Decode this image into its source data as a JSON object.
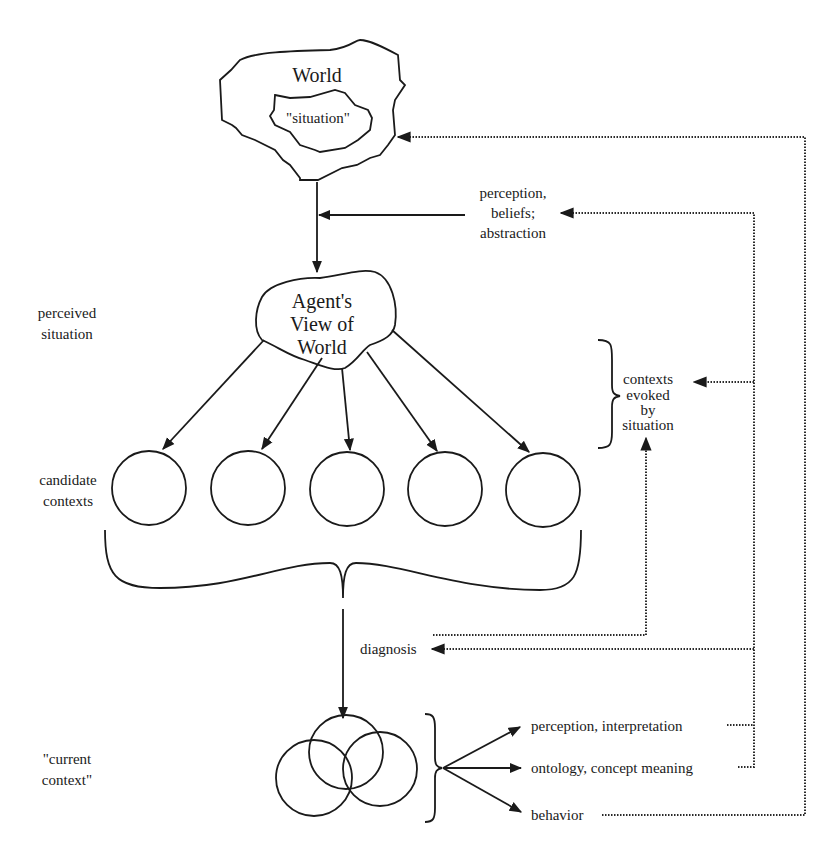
{
  "diagram": {
    "type": "flow-diagram",
    "colors": {
      "ink": "#1a1a1a",
      "background": "#ffffff"
    },
    "nodes": {
      "world": {
        "label": "World",
        "inner_label": "\"situation\""
      },
      "agent_view": {
        "line1": "Agent's",
        "line2": "View of",
        "line3": "World"
      },
      "candidate_contexts": {
        "count": 5
      },
      "current_context": {
        "count": 3
      }
    },
    "left_labels": {
      "perceived_situation": {
        "line1": "perceived",
        "line2": "situation"
      },
      "candidate_contexts": {
        "line1": "candidate",
        "line2": "contexts"
      },
      "current_context": {
        "line1": "\"current",
        "line2": "context\""
      }
    },
    "edge_labels": {
      "perception_beliefs": {
        "line1": "perception,",
        "line2": "beliefs;",
        "line3": "abstraction"
      },
      "contexts_evoked": {
        "line1": "contexts",
        "line2": "evoked",
        "line3": "by",
        "line4": "situation"
      },
      "diagnosis": "diagnosis"
    },
    "outputs": [
      {
        "label": "perception, interpretation"
      },
      {
        "label": "ontology, concept meaning"
      },
      {
        "label": "behavior"
      }
    ]
  }
}
